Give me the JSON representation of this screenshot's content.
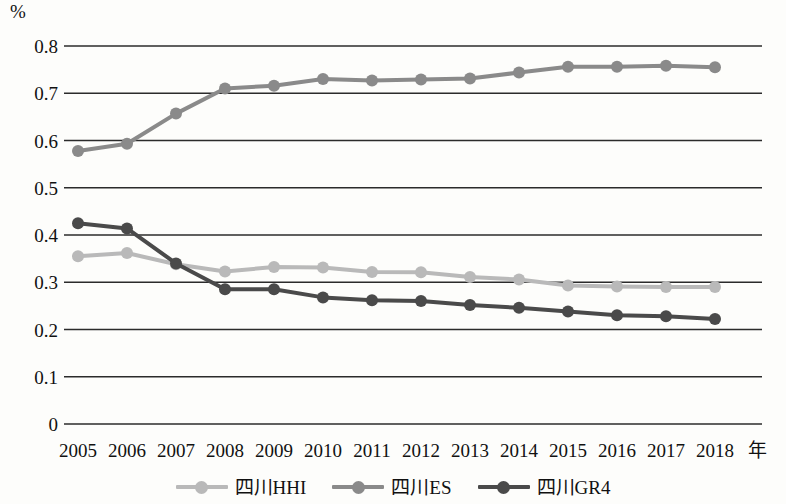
{
  "chart_data": {
    "type": "line",
    "title": "",
    "xlabel": "年",
    "ylabel": "%",
    "unit_label": "%",
    "x": [
      2005,
      2006,
      2007,
      2008,
      2009,
      2010,
      2011,
      2012,
      2013,
      2014,
      2015,
      2016,
      2017,
      2018
    ],
    "categories": [
      "2005",
      "2006",
      "2007",
      "2008",
      "2009",
      "2010",
      "2011",
      "2012",
      "2013",
      "2014",
      "2015",
      "2016",
      "2017",
      "2018"
    ],
    "ylim": [
      0,
      0.8
    ],
    "yticks": [
      "0.8",
      "0.7",
      "0.6",
      "0.5",
      "0.4",
      "0.3",
      "0.2",
      "0.1",
      "0"
    ],
    "ytick_values": [
      0.8,
      0.7,
      0.6,
      0.5,
      0.4,
      0.3,
      0.2,
      0.1,
      0
    ],
    "grid": true,
    "legend_position": "bottom",
    "series": [
      {
        "name": "四川HHI",
        "color": "#b9b9b9",
        "values": [
          0.355,
          0.362,
          0.338,
          0.323,
          0.332,
          0.331,
          0.322,
          0.321,
          0.311,
          0.306,
          0.293,
          0.291,
          0.29,
          0.29
        ]
      },
      {
        "name": "四川ES",
        "color": "#8a8a8a",
        "values": [
          0.578,
          0.593,
          0.657,
          0.71,
          0.716,
          0.73,
          0.727,
          0.729,
          0.731,
          0.744,
          0.756,
          0.756,
          0.758,
          0.755
        ]
      },
      {
        "name": "四川GR4",
        "color": "#4a4a4a",
        "values": [
          0.425,
          0.414,
          0.34,
          0.285,
          0.285,
          0.268,
          0.262,
          0.26,
          0.252,
          0.246,
          0.238,
          0.23,
          0.228,
          0.222
        ]
      }
    ]
  },
  "legend": {
    "items": [
      {
        "label": "四川HHI",
        "color": "#b9b9b9"
      },
      {
        "label": "四川ES",
        "color": "#8a8a8a"
      },
      {
        "label": "四川GR4",
        "color": "#4a4a4a"
      }
    ]
  },
  "axes": {
    "x_title": "年",
    "y_unit": "%"
  }
}
